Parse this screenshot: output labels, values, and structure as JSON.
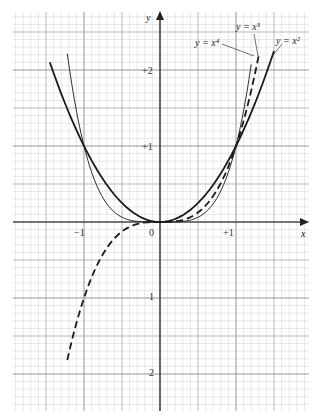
{
  "chart_data": {
    "type": "line",
    "title": "",
    "xlabel": "x",
    "ylabel": "y",
    "xlim": [
      -1.93,
      1.97
    ],
    "ylim": [
      -2.48,
      2.76
    ],
    "grid": true,
    "legend_position": "inline annotations top-right",
    "x_ticks": [
      {
        "value": -1,
        "label": "−1"
      },
      {
        "value": 0,
        "label": "0"
      },
      {
        "value": 1,
        "label": "+1"
      }
    ],
    "y_ticks": [
      {
        "value": 2,
        "label": "+2"
      },
      {
        "value": 1,
        "label": "+1"
      },
      {
        "value": -1,
        "label": "1"
      },
      {
        "value": -2,
        "label": "2"
      }
    ],
    "series": [
      {
        "name": "y = x²",
        "style": "solid-thick",
        "x": [
          -1.45,
          -1.25,
          -1.0,
          -0.75,
          -0.5,
          -0.25,
          0,
          0.25,
          0.5,
          0.75,
          1.0,
          1.25,
          1.5
        ],
        "values": [
          2.1,
          1.5625,
          1.0,
          0.5625,
          0.25,
          0.0625,
          0,
          0.0625,
          0.25,
          0.5625,
          1.0,
          1.5625,
          2.25
        ]
      },
      {
        "name": "y = x³",
        "style": "dashed-thick",
        "x": [
          -1.22,
          -1.0,
          -0.75,
          -0.5,
          -0.25,
          0,
          0.25,
          0.5,
          0.75,
          1.0,
          1.15,
          1.3
        ],
        "values": [
          -1.816,
          -1.0,
          -0.422,
          -0.125,
          -0.016,
          0,
          0.016,
          0.125,
          0.422,
          1.0,
          1.521,
          2.197
        ]
      },
      {
        "name": "y = x⁴",
        "style": "solid-thin",
        "x": [
          -1.22,
          -1.0,
          -0.75,
          -0.5,
          -0.25,
          0,
          0.25,
          0.5,
          0.75,
          1.0,
          1.1,
          1.2
        ],
        "values": [
          2.215,
          1.0,
          0.316,
          0.0625,
          0.004,
          0,
          0.004,
          0.0625,
          0.316,
          1.0,
          1.464,
          2.074
        ]
      }
    ],
    "annotations": [
      {
        "text": "y = x³",
        "target_series": "y = x³"
      },
      {
        "text": "y = x⁴",
        "target_series": "y = x⁴"
      },
      {
        "text": "y = x²",
        "target_series": "y = x²"
      }
    ]
  },
  "labels": {
    "x_axis": "x",
    "y_axis": "y",
    "ann_x3": "y = x³",
    "ann_x4": "y = x⁴",
    "ann_x2": "y = x²",
    "tick_xm1": "−1",
    "tick_x0": "0",
    "tick_xp1": "+1",
    "tick_yp2": "+2",
    "tick_yp1": "+1",
    "tick_ym1": "1",
    "tick_ym2": "2"
  },
  "colors": {
    "grid_minor": "#c8c8c8",
    "grid_major": "#8a8a8a",
    "axis": "#222222",
    "curve": "#1a1a1a"
  }
}
